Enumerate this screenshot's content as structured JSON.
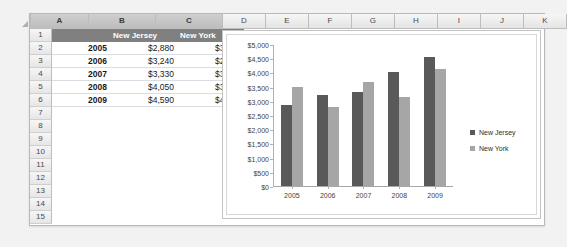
{
  "spreadsheet": {
    "corner_icon": "select-all-triangle-icon",
    "columns": [
      {
        "label": "A",
        "selected": true,
        "width": 58
      },
      {
        "label": "B",
        "selected": true,
        "width": 67
      },
      {
        "label": "C",
        "selected": true,
        "width": 67
      },
      {
        "label": "D",
        "selected": false,
        "width": 43
      },
      {
        "label": "E",
        "selected": false,
        "width": 43
      },
      {
        "label": "F",
        "selected": false,
        "width": 43
      },
      {
        "label": "G",
        "selected": false,
        "width": 43
      },
      {
        "label": "H",
        "selected": false,
        "width": 43
      },
      {
        "label": "I",
        "selected": false,
        "width": 43
      },
      {
        "label": "J",
        "selected": false,
        "width": 43
      },
      {
        "label": "K",
        "selected": false,
        "width": 43
      }
    ],
    "row_headers": [
      "1",
      "2",
      "3",
      "4",
      "5",
      "6",
      "7",
      "8",
      "9",
      "10",
      "11",
      "12",
      "13",
      "14",
      "15"
    ],
    "header_row": {
      "a": "",
      "b": "New Jersey",
      "c": "New York"
    },
    "data_rows": [
      {
        "a": "2005",
        "b": "$2,880",
        "c": "$3,510"
      },
      {
        "a": "2006",
        "b": "$3,240",
        "c": "$2,790"
      },
      {
        "a": "2007",
        "b": "$3,330",
        "c": "$3,690"
      },
      {
        "a": "2008",
        "b": "$4,050",
        "c": "$3,150"
      },
      {
        "a": "2009",
        "b": "$4,590",
        "c": "$4,140"
      }
    ],
    "empty_row_count": 9
  },
  "chart_data": {
    "type": "bar",
    "title": "",
    "xlabel": "",
    "ylabel": "",
    "categories": [
      "2005",
      "2006",
      "2007",
      "2008",
      "2009"
    ],
    "series": [
      {
        "name": "New Jersey",
        "color": "#595959",
        "values": [
          2880,
          3240,
          3330,
          4050,
          4590
        ]
      },
      {
        "name": "New York",
        "color": "#a6a6a6",
        "values": [
          3510,
          2790,
          3690,
          3150,
          4140
        ]
      }
    ],
    "ylim": [
      0,
      5000
    ],
    "ytick_values": [
      5000,
      4500,
      4000,
      3500,
      3000,
      2500,
      2000,
      1500,
      1000,
      500,
      0
    ],
    "ytick_labels": [
      "$5,000",
      "$4,500",
      "$4,000",
      "$3,500",
      "$3,000",
      "$2,500",
      "$2,000",
      "$1,500",
      "$1,000",
      "$500",
      "$0"
    ],
    "grid": false,
    "legend_position": "right"
  }
}
